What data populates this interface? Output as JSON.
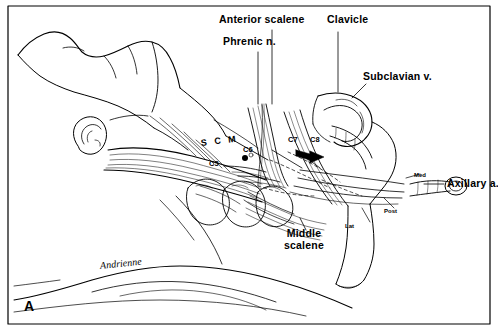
{
  "figure": {
    "panel_letter": "A",
    "signature": "Andrienne",
    "colors": {
      "ink": "#000000",
      "paper": "#ffffff"
    },
    "labels": {
      "anterior_scalene": "Anterior scalene",
      "phrenic_nerve": "Phrenic n.",
      "clavicle": "Clavicle",
      "subclavian_vein": "Subclavian v.",
      "axillary_artery": "Axillary a.",
      "middle_scalene_line1": "Middle",
      "middle_scalene_line2": "scalene",
      "scm": "S C M",
      "med": "Med",
      "post": "Post",
      "lat": "Lat",
      "root_c5": "C5",
      "root_c6": "C6",
      "root_c7": "C7",
      "root_c8": "C8",
      "root_c6b": "C6"
    }
  }
}
